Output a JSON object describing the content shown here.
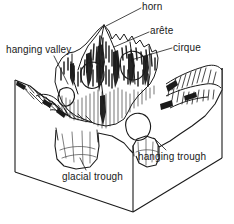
{
  "figure": {
    "type": "line-drawing-block-diagram",
    "ink_color": "#1a1a1a",
    "paper_color": "#ffffff"
  },
  "labels": {
    "horn": "horn",
    "arete": "arête",
    "cirque": "cirque",
    "hanging_valley": "hanging valley",
    "hanging_trough": "hanging trough",
    "glacial_trough": "glacial trough"
  },
  "features": [
    {
      "key": "horn",
      "label": "horn",
      "leader": true
    },
    {
      "key": "arete",
      "label": "arête",
      "leader": true
    },
    {
      "key": "cirque",
      "label": "cirque",
      "leader": true
    },
    {
      "key": "hanging_valley",
      "label": "hanging valley",
      "leader": true
    },
    {
      "key": "hanging_trough",
      "label": "hanging trough",
      "leader": true
    },
    {
      "key": "glacial_trough",
      "label": "glacial trough",
      "leader": true
    }
  ]
}
